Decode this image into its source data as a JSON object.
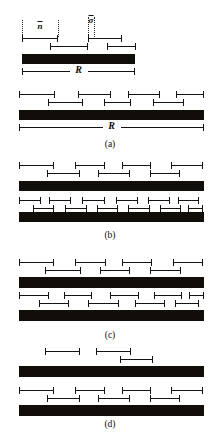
{
  "figure": {
    "background_color": "#ffffff",
    "ink_color": "#110e0a",
    "width": 220,
    "height": 447,
    "annotations": {
      "n_bar": "n",
      "sigma_bar": "σ",
      "region_label": "R"
    },
    "panels": [
      {
        "id": "a",
        "caption": "(a)",
        "caption_y": 139,
        "guides": [
          {
            "name": "guide-n-left",
            "x": 22,
            "y": 20,
            "height": 17
          },
          {
            "name": "guide-n-right",
            "x": 58,
            "y": 20,
            "height": 17
          },
          {
            "name": "guide-s-left",
            "x": 88,
            "y": 17,
            "height": 20
          },
          {
            "name": "guide-s-right",
            "x": 94,
            "y": 17,
            "height": 20
          }
        ],
        "params": [
          {
            "name": "param-n-bar",
            "label": "n",
            "x": 40,
            "y": 21
          },
          {
            "name": "param-sigma-bar",
            "label": "σ",
            "x": 91,
            "y": 15
          }
        ],
        "groups": [
          {
            "name": "group-a-sparse",
            "rows": [
              {
                "segments": [
                  {
                    "x": 22,
                    "w": 36
                  },
                  {
                    "x": 88,
                    "w": 34
                  }
                ],
                "y": 35
              },
              {
                "segments": [
                  {
                    "x": 50,
                    "w": 38
                  },
                  {
                    "x": 107,
                    "w": 29
                  }
                ],
                "y": 43
              }
            ],
            "block": {
              "x": 22,
              "y": 54,
              "w": 113,
              "h": 10
            },
            "rline": {
              "x": 22,
              "y": 67,
              "w": 113,
              "label": "R"
            }
          },
          {
            "name": "group-a-dense",
            "rows": [
              {
                "segments": [
                  {
                    "x": 19,
                    "w": 36
                  },
                  {
                    "x": 78,
                    "w": 33
                  },
                  {
                    "x": 128,
                    "w": 32
                  },
                  {
                    "x": 176,
                    "w": 28
                  }
                ],
                "y": 91
              },
              {
                "segments": [
                  {
                    "x": 48,
                    "w": 35
                  },
                  {
                    "x": 104,
                    "w": 27
                  },
                  {
                    "x": 153,
                    "w": 31
                  }
                ],
                "y": 99
              }
            ],
            "block": {
              "x": 19,
              "y": 110,
              "w": 185,
              "h": 10
            },
            "rline": {
              "x": 19,
              "y": 123,
              "w": 185,
              "label": "R"
            }
          }
        ]
      },
      {
        "id": "b",
        "caption": "(b)",
        "caption_y": 230,
        "guides": [],
        "params": [],
        "groups": [
          {
            "name": "group-b-medium",
            "rows": [
              {
                "segments": [
                  {
                    "x": 19,
                    "w": 35
                  },
                  {
                    "x": 75,
                    "w": 30
                  },
                  {
                    "x": 122,
                    "w": 29
                  },
                  {
                    "x": 171,
                    "w": 32
                  }
                ],
                "y": 162
              },
              {
                "segments": [
                  {
                    "x": 47,
                    "w": 33
                  },
                  {
                    "x": 98,
                    "w": 32
                  },
                  {
                    "x": 150,
                    "w": 30
                  }
                ],
                "y": 170
              }
            ],
            "block": {
              "x": 19,
              "y": 181,
              "w": 185,
              "h": 10
            }
          },
          {
            "name": "group-b-dense",
            "rows": [
              {
                "segments": [
                  {
                    "x": 19,
                    "w": 22
                  },
                  {
                    "x": 49,
                    "w": 22
                  },
                  {
                    "x": 82,
                    "w": 23
                  },
                  {
                    "x": 116,
                    "w": 22
                  },
                  {
                    "x": 148,
                    "w": 22
                  },
                  {
                    "x": 178,
                    "w": 21
                  }
                ],
                "y": 197
              },
              {
                "segments": [
                  {
                    "x": 33,
                    "w": 21
                  },
                  {
                    "x": 65,
                    "w": 22
                  },
                  {
                    "x": 97,
                    "w": 21
                  },
                  {
                    "x": 128,
                    "w": 22
                  },
                  {
                    "x": 160,
                    "w": 21
                  },
                  {
                    "x": 188,
                    "w": 15
                  }
                ],
                "y": 205
              }
            ],
            "block": {
              "x": 19,
              "y": 212,
              "w": 185,
              "h": 10
            }
          }
        ]
      },
      {
        "id": "c",
        "caption": "(c)",
        "caption_y": 330,
        "guides": [],
        "params": [],
        "groups": [
          {
            "name": "group-c-upper",
            "rows": [
              {
                "segments": [
                  {
                    "x": 19,
                    "w": 35
                  },
                  {
                    "x": 75,
                    "w": 31
                  },
                  {
                    "x": 122,
                    "w": 30
                  },
                  {
                    "x": 173,
                    "w": 30
                  }
                ],
                "y": 259
              },
              {
                "segments": [
                  {
                    "x": 45,
                    "w": 36
                  },
                  {
                    "x": 100,
                    "w": 30
                  },
                  {
                    "x": 150,
                    "w": 31
                  }
                ],
                "y": 267
              }
            ],
            "block": {
              "x": 19,
              "y": 277,
              "w": 185,
              "h": 11
            }
          },
          {
            "name": "group-c-lower",
            "rows": [
              {
                "segments": [
                  {
                    "x": 19,
                    "w": 30
                  },
                  {
                    "x": 64,
                    "w": 28
                  },
                  {
                    "x": 110,
                    "w": 29
                  },
                  {
                    "x": 154,
                    "w": 28
                  },
                  {
                    "x": 189,
                    "w": 15
                  }
                ],
                "y": 292
              },
              {
                "segments": [
                  {
                    "x": 39,
                    "w": 30
                  },
                  {
                    "x": 88,
                    "w": 31
                  },
                  {
                    "x": 135,
                    "w": 30
                  },
                  {
                    "x": 175,
                    "w": 24
                  }
                ],
                "y": 300
              }
            ],
            "block": {
              "x": 19,
              "y": 310,
              "w": 185,
              "h": 11
            }
          }
        ]
      },
      {
        "id": "d",
        "caption": "(d)",
        "caption_y": 419,
        "guides": [],
        "params": [],
        "groups": [
          {
            "name": "group-d-sparse",
            "rows": [
              {
                "segments": [
                  {
                    "x": 45,
                    "w": 35
                  },
                  {
                    "x": 96,
                    "w": 35
                  }
                ],
                "y": 348
              },
              {
                "segments": [
                  {
                    "x": 120,
                    "w": 33
                  }
                ],
                "y": 356
              }
            ],
            "block": {
              "x": 19,
              "y": 366,
              "w": 185,
              "h": 11
            }
          },
          {
            "name": "group-d-medium",
            "rows": [
              {
                "segments": [
                  {
                    "x": 19,
                    "w": 35
                  },
                  {
                    "x": 75,
                    "w": 30
                  },
                  {
                    "x": 122,
                    "w": 29
                  },
                  {
                    "x": 171,
                    "w": 32
                  }
                ],
                "y": 387
              },
              {
                "segments": [
                  {
                    "x": 47,
                    "w": 33
                  },
                  {
                    "x": 98,
                    "w": 32
                  },
                  {
                    "x": 150,
                    "w": 30
                  }
                ],
                "y": 395
              }
            ],
            "block": {
              "x": 19,
              "y": 405,
              "w": 185,
              "h": 11
            }
          }
        ]
      }
    ]
  }
}
